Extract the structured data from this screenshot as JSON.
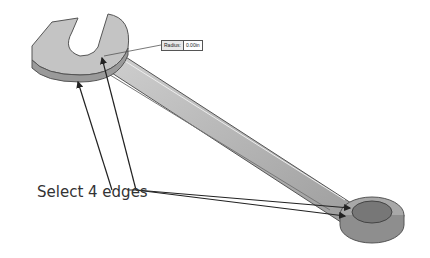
{
  "viewport": {
    "description": "3D CAD view of combination wrench with fillet operation"
  },
  "dimension_tag": {
    "label": "Radius:",
    "value": "0.00in"
  },
  "callout": {
    "text": "Select 4 edges"
  },
  "colors": {
    "model_fill": "#b8b8b8",
    "model_edge": "#555555",
    "arrow": "#222222",
    "background": "#ffffff"
  }
}
